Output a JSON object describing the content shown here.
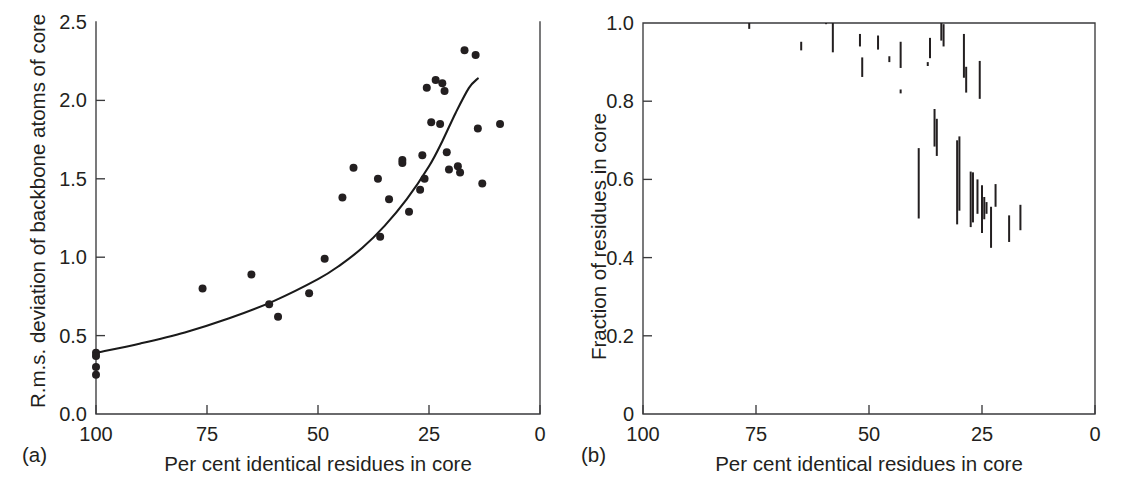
{
  "figure": {
    "width": 1125,
    "height": 500,
    "background": "#ffffff",
    "ink_color": "#231f20",
    "axis_color": "#3a3a3c"
  },
  "panels": [
    {
      "caption": "(a)",
      "xlabel": "Per cent identical residues in core",
      "ylabel": "R.m.s. deviation of backbone atoms of core",
      "xticks": [
        "100",
        "75",
        "50",
        "25",
        "0"
      ],
      "yticks": [
        "0.0",
        "0.5",
        "1.0",
        "1.5",
        "2.0",
        "2.5"
      ]
    },
    {
      "caption": "(b)",
      "xlabel": "Per cent identical residues in core",
      "ylabel": "Fraction of residues in core",
      "xticks": [
        "100",
        "75",
        "50",
        "25",
        "0"
      ],
      "yticks": [
        "0",
        "0.2",
        "0.4",
        "0.6",
        "0.8",
        "1.0"
      ]
    }
  ],
  "chart_data": [
    {
      "panel": "a",
      "type": "scatter",
      "title": "",
      "xlabel": "Per cent identical residues in core",
      "ylabel": "R.m.s. deviation of backbone atoms of core",
      "xlim": [
        100,
        0
      ],
      "ylim": [
        0.0,
        2.5
      ],
      "x_inverted": true,
      "xticks": [
        100,
        75,
        50,
        25,
        0
      ],
      "yticks": [
        0.0,
        0.5,
        1.0,
        1.5,
        2.0,
        2.5
      ],
      "grid": false,
      "legend": null,
      "points": [
        [
          100.0,
          0.39
        ],
        [
          100.0,
          0.37
        ],
        [
          100.0,
          0.3
        ],
        [
          100.0,
          0.25
        ],
        [
          76.0,
          0.8
        ],
        [
          65.0,
          0.89
        ],
        [
          61.0,
          0.7
        ],
        [
          59.0,
          0.62
        ],
        [
          52.0,
          0.77
        ],
        [
          48.5,
          0.99
        ],
        [
          44.5,
          1.38
        ],
        [
          42.0,
          1.57
        ],
        [
          36.5,
          1.5
        ],
        [
          36.0,
          1.13
        ],
        [
          34.0,
          1.37
        ],
        [
          31.0,
          1.62
        ],
        [
          31.0,
          1.6
        ],
        [
          29.5,
          1.29
        ],
        [
          27.0,
          1.43
        ],
        [
          26.5,
          1.65
        ],
        [
          26.0,
          1.5
        ],
        [
          25.5,
          2.08
        ],
        [
          24.5,
          1.86
        ],
        [
          23.5,
          2.13
        ],
        [
          22.5,
          1.85
        ],
        [
          22.0,
          2.11
        ],
        [
          21.5,
          2.06
        ],
        [
          21.0,
          1.67
        ],
        [
          20.5,
          1.56
        ],
        [
          18.5,
          1.58
        ],
        [
          18.0,
          1.54
        ],
        [
          17.0,
          2.32
        ],
        [
          14.5,
          2.29
        ],
        [
          14.0,
          1.82
        ],
        [
          13.0,
          1.47
        ],
        [
          9.0,
          1.85
        ]
      ],
      "fit_curve": {
        "description": "smooth increasing exponential-like trend line",
        "points": [
          [
            100.0,
            0.39
          ],
          [
            90.0,
            0.45
          ],
          [
            80.0,
            0.52
          ],
          [
            70.0,
            0.61
          ],
          [
            60.0,
            0.72
          ],
          [
            50.0,
            0.86
          ],
          [
            45.0,
            0.95
          ],
          [
            40.0,
            1.06
          ],
          [
            35.0,
            1.2
          ],
          [
            30.0,
            1.37
          ],
          [
            25.0,
            1.58
          ],
          [
            22.0,
            1.74
          ],
          [
            19.0,
            1.92
          ],
          [
            16.0,
            2.08
          ],
          [
            14.0,
            2.14
          ]
        ]
      }
    },
    {
      "panel": "b",
      "type": "range-bar",
      "title": "",
      "xlabel": "Per cent identical residues in core",
      "ylabel": "Fraction of residues in core",
      "xlim": [
        100,
        0
      ],
      "ylim": [
        0.0,
        1.0
      ],
      "x_inverted": true,
      "xticks": [
        100,
        75,
        50,
        25,
        0
      ],
      "yticks": [
        0,
        0.2,
        0.4,
        0.6,
        0.8,
        1.0
      ],
      "grid": false,
      "legend": null,
      "bars": [
        [
          76.5,
          0.985,
          1.0
        ],
        [
          65.0,
          0.93,
          0.952
        ],
        [
          59.5,
          0.997,
          1.0
        ],
        [
          58.0,
          0.925,
          1.0
        ],
        [
          52.0,
          0.94,
          0.972
        ],
        [
          51.5,
          0.862,
          0.912
        ],
        [
          48.0,
          0.932,
          0.968
        ],
        [
          45.5,
          0.9,
          0.915
        ],
        [
          43.0,
          0.885,
          0.952
        ],
        [
          43.0,
          0.82,
          0.83
        ],
        [
          39.0,
          0.5,
          0.68
        ],
        [
          37.0,
          0.89,
          0.9
        ],
        [
          36.5,
          0.91,
          0.962
        ],
        [
          35.5,
          0.684,
          0.78
        ],
        [
          35.0,
          0.66,
          0.755
        ],
        [
          34.0,
          0.955,
          1.0
        ],
        [
          33.5,
          0.94,
          0.997
        ],
        [
          30.5,
          0.485,
          0.7
        ],
        [
          30.0,
          0.52,
          0.71
        ],
        [
          29.0,
          0.86,
          0.972
        ],
        [
          28.5,
          0.822,
          0.888
        ],
        [
          27.5,
          0.478,
          0.62
        ],
        [
          27.0,
          0.49,
          0.618
        ],
        [
          26.0,
          0.512,
          0.6
        ],
        [
          25.5,
          0.806,
          0.903
        ],
        [
          25.0,
          0.463,
          0.585
        ],
        [
          24.5,
          0.498,
          0.555
        ],
        [
          24.0,
          0.512,
          0.542
        ],
        [
          23.0,
          0.425,
          0.53
        ],
        [
          22.0,
          0.53,
          0.588
        ],
        [
          19.0,
          0.44,
          0.508
        ],
        [
          16.5,
          0.47,
          0.535
        ]
      ]
    }
  ]
}
